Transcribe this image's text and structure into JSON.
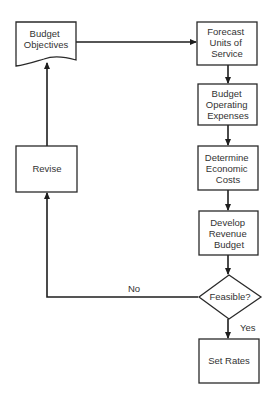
{
  "diagram": {
    "type": "flowchart",
    "colors": {
      "line": "#1e1e1e",
      "fill": "#ffffff",
      "text": "#333333"
    },
    "nodes": [
      {
        "id": "budget-objectives",
        "shape": "document",
        "lines": [
          "Budget",
          "Objectives"
        ]
      },
      {
        "id": "forecast-units",
        "shape": "process",
        "lines": [
          "Forecast",
          "Units of",
          "Service"
        ]
      },
      {
        "id": "budget-operating",
        "shape": "process",
        "lines": [
          "Budget",
          "Operating",
          "Expenses"
        ]
      },
      {
        "id": "determine-costs",
        "shape": "process",
        "lines": [
          "Determine",
          "Economic",
          "Costs"
        ]
      },
      {
        "id": "develop-revenue",
        "shape": "process",
        "lines": [
          "Develop",
          "Revenue",
          "Budget"
        ]
      },
      {
        "id": "feasible",
        "shape": "decision",
        "lines": [
          "Feasible?"
        ]
      },
      {
        "id": "set-rates",
        "shape": "process",
        "lines": [
          "Set Rates"
        ]
      },
      {
        "id": "revise",
        "shape": "process",
        "lines": [
          "Revise"
        ]
      }
    ],
    "edges": [
      {
        "from": "budget-objectives",
        "to": "forecast-units",
        "label": ""
      },
      {
        "from": "forecast-units",
        "to": "budget-operating",
        "label": ""
      },
      {
        "from": "budget-operating",
        "to": "determine-costs",
        "label": ""
      },
      {
        "from": "determine-costs",
        "to": "develop-revenue",
        "label": ""
      },
      {
        "from": "develop-revenue",
        "to": "feasible",
        "label": ""
      },
      {
        "from": "feasible",
        "to": "set-rates",
        "label": "Yes"
      },
      {
        "from": "feasible",
        "to": "revise",
        "label": "No"
      },
      {
        "from": "revise",
        "to": "budget-objectives",
        "label": ""
      }
    ]
  }
}
